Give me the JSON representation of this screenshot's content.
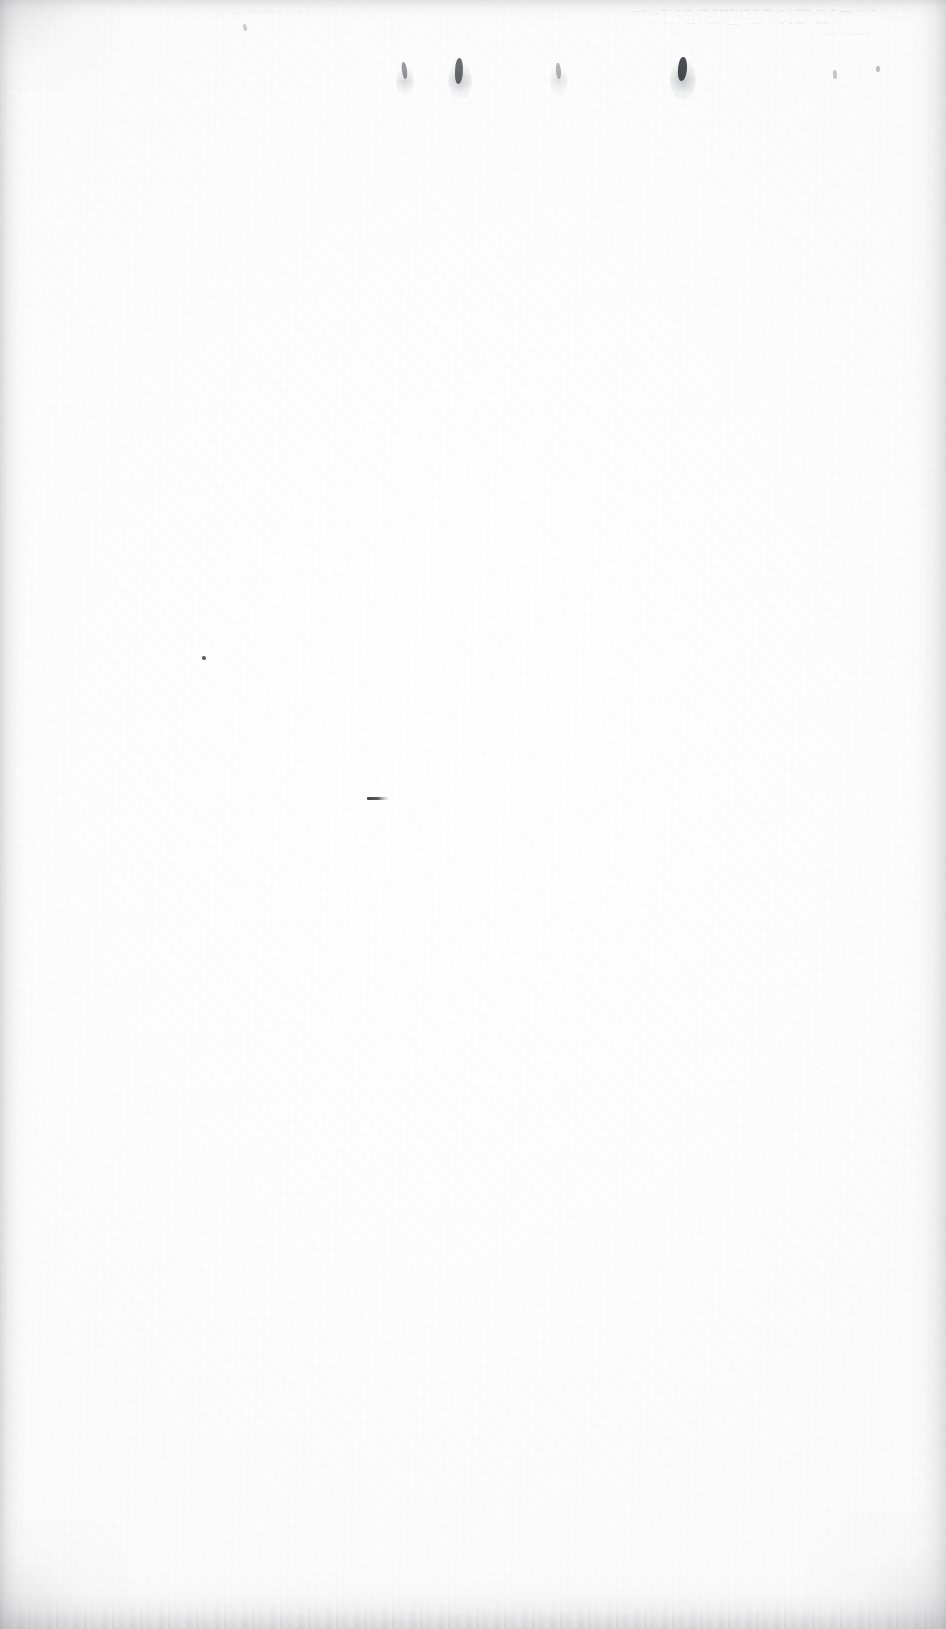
{
  "page": {
    "kind": "scanned-blank-page",
    "width": 946,
    "height": 1629,
    "paper_color": "#fdfdfd",
    "background_color": "#ffffff",
    "ink_color": "#2f3034",
    "shadow_color": "#969698",
    "ghost_text_color": "#606268",
    "content_text": "",
    "caption": ""
  },
  "artifacts": {
    "ghost_rows": [
      {
        "name": "ghost-bleed-row-top",
        "text": "~ ~  ·· —-  ·  ~· -·~ ·~  ~--~  ·- ~ ~· -  ··~~ ·- ~ — ·· ~"
      },
      {
        "name": "ghost-bleed-row-second",
        "text": "· -~· ~  ·· ~-  · ~~· — ·  -~ ··  ~ -·~ · ~~"
      },
      {
        "name": "ghost-bleed-row-third",
        "text": "~· — ·· -~  ·~ ~-·"
      },
      {
        "name": "ghost-bleed-row-left",
        "text": "· ~  ·· -  ~· —  ·~ ~· - ·· ~"
      }
    ],
    "specks": [
      {
        "name": "ink-speck-1",
        "x": 402,
        "y": 62,
        "w": 5,
        "h": 17,
        "opacity": 0.48,
        "rot": -6
      },
      {
        "name": "ink-speck-2",
        "x": 455,
        "y": 58,
        "w": 8,
        "h": 26,
        "opacity": 0.7,
        "rot": 4
      },
      {
        "name": "ink-speck-3",
        "x": 556,
        "y": 63,
        "w": 5,
        "h": 16,
        "opacity": 0.34,
        "rot": -3
      },
      {
        "name": "ink-speck-4",
        "x": 678,
        "y": 57,
        "w": 9,
        "h": 24,
        "opacity": 0.86,
        "rot": 7
      },
      {
        "name": "ink-speck-5",
        "x": 833,
        "y": 70,
        "w": 4,
        "h": 9,
        "opacity": 0.26,
        "rot": 0
      },
      {
        "name": "ink-speck-6",
        "x": 202,
        "y": 656,
        "w": 4,
        "h": 4,
        "opacity": 0.8,
        "rot": 0
      },
      {
        "name": "ink-speck-7",
        "x": 243,
        "y": 24,
        "w": 4,
        "h": 7,
        "opacity": 0.22,
        "rot": -8
      },
      {
        "name": "ink-speck-8",
        "x": 876,
        "y": 66,
        "w": 4,
        "h": 6,
        "opacity": 0.3,
        "rot": 5
      }
    ],
    "soft_blooms": [
      {
        "name": "ink-bloom-1",
        "x": 396,
        "y": 66,
        "w": 18,
        "h": 30,
        "opacity": 0.4
      },
      {
        "name": "ink-bloom-2",
        "x": 448,
        "y": 62,
        "w": 24,
        "h": 38,
        "opacity": 0.52
      },
      {
        "name": "ink-bloom-3",
        "x": 550,
        "y": 66,
        "w": 18,
        "h": 30,
        "opacity": 0.3
      },
      {
        "name": "ink-bloom-4",
        "x": 670,
        "y": 60,
        "w": 26,
        "h": 40,
        "opacity": 0.6
      }
    ],
    "dash_mark": {
      "name": "ink-dash-mark",
      "x": 367,
      "y": 797,
      "w": 22,
      "h": 3,
      "opacity": 0.88
    }
  }
}
